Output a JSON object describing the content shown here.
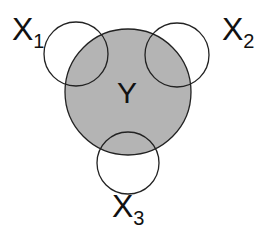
{
  "diagram": {
    "type": "venn",
    "colors": {
      "fill": "#b4b4b4",
      "stroke": "#222222",
      "background": "#ffffff"
    },
    "center": {
      "label": "Y",
      "cx": 128,
      "cy": 92,
      "r": 63
    },
    "satellites": [
      {
        "label": "X",
        "sub": "1",
        "cx": 76,
        "cy": 54,
        "r": 32,
        "lx": 12,
        "ly": 40
      },
      {
        "label": "X",
        "sub": "2",
        "cx": 177,
        "cy": 55,
        "r": 32,
        "lx": 225,
        "ly": 40
      },
      {
        "label": "X",
        "sub": "3",
        "cx": 128,
        "cy": 163,
        "r": 31,
        "lx": 112,
        "ly": 216
      }
    ]
  }
}
